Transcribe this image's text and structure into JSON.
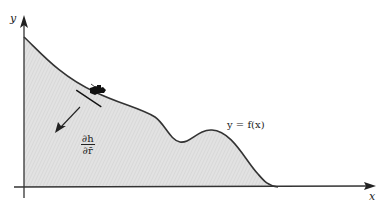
{
  "figure": {
    "axes": {
      "x_label": "x",
      "y_label": "y"
    },
    "curve": {
      "label": "y = f(x)",
      "fill_color": "#dcdcdc",
      "stroke_color": "#333333"
    },
    "gradient": {
      "numerator": "∂h",
      "denominator": "∂r̄"
    },
    "icons": {
      "skier": "skier-icon"
    }
  }
}
